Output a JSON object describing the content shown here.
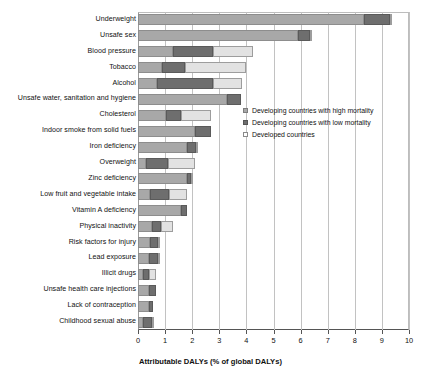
{
  "chart_data": {
    "type": "bar",
    "orientation": "horizontal",
    "stacked": true,
    "title": "",
    "xlabel": "Attributable DALYs (% of global DALYs)",
    "ylabel": "",
    "xlim": [
      0,
      10
    ],
    "xticks": [
      "0",
      "1",
      "2",
      "3",
      "4",
      "5",
      "6",
      "7",
      "8",
      "9",
      "10"
    ],
    "grid": "vertical",
    "legend_position": "inside-right",
    "categories": [
      "Underweight",
      "Unsafe sex",
      "Blood pressure",
      "Tobacco",
      "Alcohol",
      "Unsafe water, sanitation and hygiene",
      "Cholesterol",
      "Indoor smoke from solid fuels",
      "Iron deficiency",
      "Overweight",
      "Zinc deficiency",
      "Low fruit and vegetable intake",
      "Vitamin A deficiency",
      "Physical inactivity",
      "Risk factors for injury",
      "Lead exposure",
      "Illicit drugs",
      "Unsafe health care injections",
      "Lack of contraception",
      "Childhood sexual abuse"
    ],
    "series": [
      {
        "name": "Developing countries with high mortality",
        "color": "#a8a8a8",
        "values": [
          8.35,
          5.9,
          1.3,
          0.9,
          0.7,
          3.3,
          1.05,
          2.1,
          1.8,
          0.3,
          1.8,
          0.45,
          1.6,
          0.5,
          0.45,
          0.4,
          0.2,
          0.4,
          0.4,
          0.2
        ]
      },
      {
        "name": "Developing countries with low mortality",
        "color": "#6e6e6e",
        "values": [
          0.95,
          0.45,
          1.45,
          0.85,
          2.05,
          0.5,
          0.55,
          0.6,
          0.35,
          0.8,
          0.15,
          0.7,
          0.2,
          0.35,
          0.3,
          0.35,
          0.2,
          0.25,
          0.15,
          0.3
        ]
      },
      {
        "name": "Developed countries",
        "color": "#e2e2e2",
        "values": [
          0.05,
          0.08,
          1.5,
          2.25,
          1.1,
          0.0,
          1.1,
          0.0,
          0.08,
          1.0,
          0.05,
          0.65,
          0.0,
          0.45,
          0.08,
          0.08,
          0.25,
          0.0,
          0.0,
          0.05
        ]
      }
    ]
  },
  "axis": {
    "x_title": "Attributable DALYs (% of global DALYs)",
    "ticks": [
      "0",
      "1",
      "2",
      "3",
      "4",
      "5",
      "6",
      "7",
      "8",
      "9",
      "10"
    ]
  },
  "legend": {
    "items": [
      {
        "label": "Developing countries with high mortality",
        "swatch": "high-mortality-swatch"
      },
      {
        "label": "Developing countries with low mortality",
        "swatch": "low-mortality-swatch"
      },
      {
        "label": "Developed countries",
        "swatch": "developed-swatch"
      }
    ]
  }
}
